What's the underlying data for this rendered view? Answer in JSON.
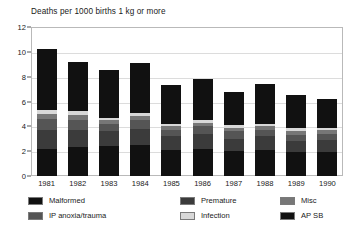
{
  "chart_data": {
    "type": "bar",
    "subtype": "stacked",
    "title": "Deaths per 1000 births 1 kg or more",
    "xlabel": "",
    "ylabel": "",
    "ylim": [
      0,
      12
    ],
    "yticks": [
      0,
      2,
      4,
      6,
      8,
      10,
      12
    ],
    "grid": true,
    "legend_position": "bottom",
    "categories": [
      "1981",
      "1982",
      "1983",
      "1984",
      "1985",
      "1986",
      "1987",
      "1988",
      "1989",
      "1990"
    ],
    "series": [
      {
        "name": "AP SB",
        "color": "#111111",
        "values": [
          2.2,
          2.3,
          2.4,
          2.5,
          2.1,
          2.2,
          2.0,
          2.1,
          1.9,
          1.9
        ]
      },
      {
        "name": "Premature",
        "color": "#3b3b3b",
        "values": [
          1.5,
          1.4,
          1.2,
          1.3,
          1.1,
          1.2,
          1.0,
          1.1,
          0.9,
          1.0
        ]
      },
      {
        "name": "IP anoxia/trauma",
        "color": "#555555",
        "values": [
          0.9,
          0.8,
          0.6,
          0.7,
          0.5,
          0.6,
          0.6,
          0.5,
          0.5,
          0.5
        ]
      },
      {
        "name": "Misc",
        "color": "#777777",
        "values": [
          0.4,
          0.4,
          0.3,
          0.3,
          0.3,
          0.3,
          0.3,
          0.3,
          0.3,
          0.3
        ]
      },
      {
        "name": "Infection",
        "color": "#d8d8d8",
        "values": [
          0.3,
          0.3,
          0.2,
          0.3,
          0.2,
          0.2,
          0.2,
          0.2,
          0.3,
          0.2
        ]
      },
      {
        "name": "Malformed",
        "color": "#111111",
        "values": [
          4.9,
          4.0,
          3.8,
          4.0,
          3.1,
          3.3,
          2.7,
          3.2,
          2.6,
          2.3
        ]
      }
    ],
    "totals": [
      10.2,
      9.2,
      8.5,
      9.1,
      7.3,
      7.8,
      6.8,
      7.4,
      6.5,
      6.2
    ]
  },
  "legend": {
    "items": [
      {
        "label": "Malformed",
        "color": "#111111"
      },
      {
        "label": "IP anoxia/trauma",
        "color": "#555555"
      },
      {
        "label": "Premature",
        "color": "#3b3b3b"
      },
      {
        "label": "Infection",
        "color": "#d8d8d8"
      },
      {
        "label": "Misc",
        "color": "#777777"
      },
      {
        "label": "AP SB",
        "color": "#111111"
      }
    ]
  }
}
